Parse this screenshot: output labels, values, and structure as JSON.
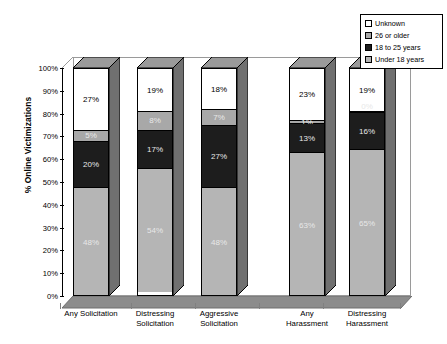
{
  "chart_data": {
    "type": "bar",
    "subtype": "stacked-100-percent-3d",
    "title": "",
    "xlabel": "",
    "ylabel": "% Online Victimizations",
    "ylim": [
      0,
      100
    ],
    "yticks": [
      "0%",
      "10%",
      "20%",
      "30%",
      "40%",
      "50%",
      "60%",
      "70%",
      "80%",
      "90%",
      "100%"
    ],
    "grid": false,
    "legend_position": "top-right",
    "categories": [
      "Any Solicitation",
      "Distressing Solicitation",
      "Aggressive Solicitation",
      "Any Harassment",
      "Distressing Harassment"
    ],
    "category_lines": [
      [
        "Any Solicitation"
      ],
      [
        "Distressing",
        "Solicitation"
      ],
      [
        "Aggressive",
        "Solicitation"
      ],
      [
        "Any",
        "Harassment"
      ],
      [
        "Distressing",
        "Harassment"
      ]
    ],
    "series": [
      {
        "name": "Under 18 years",
        "color": "#b5b5b5",
        "values": [
          48,
          54,
          48,
          63,
          65
        ],
        "labels": [
          "48%",
          "54%",
          "48%",
          "63%",
          "65%"
        ]
      },
      {
        "name": "18 to 25 years",
        "color": "#1d1d1d",
        "values": [
          20,
          17,
          27,
          13,
          16
        ],
        "labels": [
          "20%",
          "17%",
          "27%",
          "13%",
          "16%"
        ]
      },
      {
        "name": "26 or older",
        "color": "#a8a8a8",
        "values": [
          5,
          8,
          7,
          1,
          0
        ],
        "labels": [
          "5%",
          "8%",
          "7%",
          "1%",
          "0%"
        ]
      },
      {
        "name": "Unknown",
        "color": "#ffffff",
        "values": [
          27,
          19,
          18,
          23,
          19
        ],
        "labels": [
          "27%",
          "19%",
          "18%",
          "23%",
          "19%"
        ]
      }
    ]
  },
  "legend": {
    "items": [
      {
        "label": "Unknown",
        "color": "#ffffff"
      },
      {
        "label": "26 or older",
        "color": "#a8a8a8"
      },
      {
        "label": "18 to 25 years",
        "color": "#1d1d1d"
      },
      {
        "label": "Under 18 years",
        "color": "#b5b5b5"
      }
    ]
  },
  "axes": {
    "y_title": "% Online Victimizations",
    "y_ticks": [
      "100%",
      "90%",
      "80%",
      "70%",
      "60%",
      "50%",
      "40%",
      "30%",
      "20%",
      "10%",
      "0%"
    ]
  },
  "colors": {
    "unknown": "#ffffff",
    "older26": "#a8a8a8",
    "age18to25": "#1d1d1d",
    "under18": "#b5b5b5",
    "floor": "#8c8c8c",
    "outline": "#000000"
  }
}
